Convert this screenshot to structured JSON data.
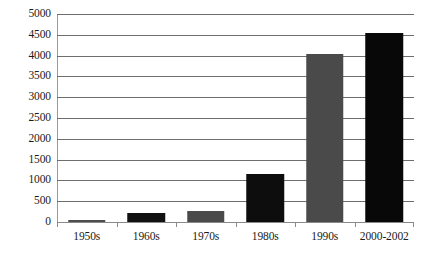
{
  "chart_data": {
    "type": "bar",
    "title": "",
    "subtitle": "",
    "xlabel": "",
    "ylabel": "",
    "categories": [
      "1950s",
      "1960s",
      "1970s",
      "1980s",
      "1990s",
      "2000-2002"
    ],
    "values": [
      50,
      215,
      265,
      1150,
      4050,
      4550
    ],
    "series": [
      {
        "name": "",
        "values": [
          50,
          215,
          265,
          1150,
          4050,
          4550
        ]
      }
    ],
    "bar_colors": [
      "#4d4d4d",
      "#111111",
      "#4a4a4a",
      "#0d0d0d",
      "#4a4a4a",
      "#080808"
    ],
    "ylim": [
      0,
      5000
    ],
    "ytick_step": 500,
    "ytick_labels": [
      "5000",
      "4500",
      "4000",
      "3500",
      "3000",
      "2500",
      "2000",
      "1500",
      "1000",
      "500",
      "0"
    ],
    "ytick_values": [
      5000,
      4500,
      4000,
      3500,
      3000,
      2500,
      2000,
      1500,
      1000,
      500,
      0
    ],
    "grid": true,
    "grid_axis": "y",
    "legend": false,
    "legend_position": "none",
    "background_color": "#ffffff",
    "gridline_color": "#6e6e6e",
    "axis_color": "#8a8a8a",
    "text_color": "#1b1b1b"
  }
}
